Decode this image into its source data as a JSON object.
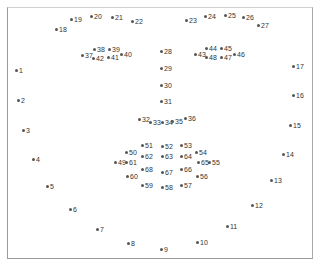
{
  "diagram": {
    "landmarks": [
      {
        "id": "1",
        "x": 17,
        "y": 71
      },
      {
        "id": "2",
        "x": 19,
        "y": 101
      },
      {
        "id": "3",
        "x": 24,
        "y": 131
      },
      {
        "id": "4",
        "x": 34,
        "y": 160
      },
      {
        "id": "5",
        "x": 48,
        "y": 187
      },
      {
        "id": "6",
        "x": 71,
        "y": 210
      },
      {
        "id": "7",
        "x": 98,
        "y": 230
      },
      {
        "id": "8",
        "x": 129,
        "y": 244
      },
      {
        "id": "9",
        "x": 162,
        "y": 250
      },
      {
        "id": "10",
        "x": 198,
        "y": 243
      },
      {
        "id": "11",
        "x": 228,
        "y": 227
      },
      {
        "id": "12",
        "x": 253,
        "y": 206
      },
      {
        "id": "13",
        "x": 272,
        "y": 181
      },
      {
        "id": "14",
        "x": 284,
        "y": 155
      },
      {
        "id": "15",
        "x": 291,
        "y": 126
      },
      {
        "id": "16",
        "x": 294,
        "y": 96
      },
      {
        "id": "17",
        "x": 294,
        "y": 67
      },
      {
        "id": "18",
        "x": 57,
        "y": 30
      },
      {
        "id": "19",
        "x": 72,
        "y": 20
      },
      {
        "id": "20",
        "x": 92,
        "y": 17
      },
      {
        "id": "21",
        "x": 113,
        "y": 18
      },
      {
        "id": "22",
        "x": 133,
        "y": 22
      },
      {
        "id": "23",
        "x": 187,
        "y": 21
      },
      {
        "id": "24",
        "x": 206,
        "y": 17
      },
      {
        "id": "25",
        "x": 226,
        "y": 16
      },
      {
        "id": "26",
        "x": 244,
        "y": 18
      },
      {
        "id": "27",
        "x": 259,
        "y": 26
      },
      {
        "id": "28",
        "x": 162,
        "y": 52
      },
      {
        "id": "29",
        "x": 162,
        "y": 69
      },
      {
        "id": "30",
        "x": 162,
        "y": 86
      },
      {
        "id": "31",
        "x": 162,
        "y": 102
      },
      {
        "id": "32",
        "x": 140,
        "y": 120
      },
      {
        "id": "33",
        "x": 151,
        "y": 123
      },
      {
        "id": "34",
        "x": 163,
        "y": 123
      },
      {
        "id": "35",
        "x": 173,
        "y": 122
      },
      {
        "id": "36",
        "x": 186,
        "y": 119
      },
      {
        "id": "37",
        "x": 83,
        "y": 56
      },
      {
        "id": "38",
        "x": 95,
        "y": 50
      },
      {
        "id": "39",
        "x": 110,
        "y": 50
      },
      {
        "id": "40",
        "x": 122,
        "y": 55
      },
      {
        "id": "41",
        "x": 109,
        "y": 58
      },
      {
        "id": "42",
        "x": 94,
        "y": 59
      },
      {
        "id": "43",
        "x": 196,
        "y": 55
      },
      {
        "id": "44",
        "x": 207,
        "y": 49
      },
      {
        "id": "45",
        "x": 222,
        "y": 49
      },
      {
        "id": "46",
        "x": 235,
        "y": 55
      },
      {
        "id": "47",
        "x": 222,
        "y": 58
      },
      {
        "id": "48",
        "x": 207,
        "y": 58
      },
      {
        "id": "49",
        "x": 116,
        "y": 163
      },
      {
        "id": "50",
        "x": 127,
        "y": 153
      },
      {
        "id": "51",
        "x": 143,
        "y": 146
      },
      {
        "id": "52",
        "x": 163,
        "y": 147
      },
      {
        "id": "53",
        "x": 182,
        "y": 146
      },
      {
        "id": "54",
        "x": 197,
        "y": 153
      },
      {
        "id": "55",
        "x": 210,
        "y": 163
      },
      {
        "id": "56",
        "x": 198,
        "y": 177
      },
      {
        "id": "57",
        "x": 182,
        "y": 186
      },
      {
        "id": "58",
        "x": 163,
        "y": 188
      },
      {
        "id": "59",
        "x": 143,
        "y": 186
      },
      {
        "id": "60",
        "x": 128,
        "y": 177
      },
      {
        "id": "61",
        "x": 127,
        "y": 163
      },
      {
        "id": "62",
        "x": 143,
        "y": 157
      },
      {
        "id": "63",
        "x": 163,
        "y": 157
      },
      {
        "id": "64",
        "x": 182,
        "y": 157
      },
      {
        "id": "65",
        "x": 199,
        "y": 163
      },
      {
        "id": "66",
        "x": 182,
        "y": 170
      },
      {
        "id": "67",
        "x": 163,
        "y": 173
      },
      {
        "id": "68",
        "x": 143,
        "y": 170
      }
    ]
  }
}
